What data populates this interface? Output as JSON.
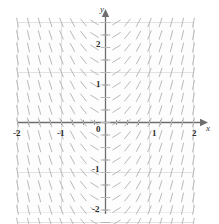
{
  "chart_data": {
    "type": "scatter",
    "subtype": "slope-field",
    "title": "",
    "xlabel": "x",
    "ylabel": "y",
    "xlim": [
      -2.15,
      2.15
    ],
    "ylim": [
      -2.15,
      2.15
    ],
    "xticks": [
      -2,
      -1,
      0,
      1,
      2
    ],
    "yticks": [
      -2,
      -1,
      0,
      1,
      2
    ],
    "xtick_labels": [
      "-2",
      "-1",
      "0",
      "1",
      "2"
    ],
    "ytick_labels": [
      "-2",
      "-1",
      "0",
      "1",
      "2"
    ],
    "minor_tick_step": 0.25,
    "grid": true,
    "grid_color": "#e2e2e2",
    "axis_color": "#6e6e6e",
    "tick_color": "#9a9a9a",
    "segment_color": "#b9b9b9",
    "plot_bg": "#fdfdfd",
    "plot_border_color": "#ededed",
    "legend": "none",
    "annotations": [],
    "slope_rule": "dy/dx = f(x) increasing with x; slope approx 2.2*x",
    "sample_x": [
      -2.0,
      -1.75,
      -1.5,
      -1.25,
      -1.0,
      -0.75,
      -0.5,
      -0.25,
      0.0,
      0.25,
      0.5,
      0.75,
      1.0,
      1.25,
      1.5,
      1.75,
      2.0
    ],
    "sample_slopes": [
      -4.4,
      -3.85,
      -3.3,
      -2.75,
      -2.2,
      -1.65,
      -1.1,
      -0.55,
      0.0,
      0.55,
      1.1,
      1.65,
      2.2,
      2.75,
      3.3,
      3.85,
      4.4
    ],
    "sample_y": [
      -2.0,
      -1.75,
      -1.5,
      -1.25,
      -1.0,
      -0.75,
      -0.5,
      -0.25,
      0.0,
      0.25,
      0.5,
      0.75,
      1.0,
      1.25,
      1.5,
      1.75,
      2.0
    ],
    "grid_step": 0.25,
    "segment_length_px": 9
  },
  "labels": {
    "x_axis": "x",
    "y_axis": "y",
    "x_neg2": "-2",
    "x_neg1": "-1",
    "x_pos1": "1",
    "x_pos2": "2",
    "y_pos2": "2",
    "y_pos1": "1",
    "y_zero": "0",
    "y_neg1": "-1",
    "y_neg2": "-2"
  }
}
